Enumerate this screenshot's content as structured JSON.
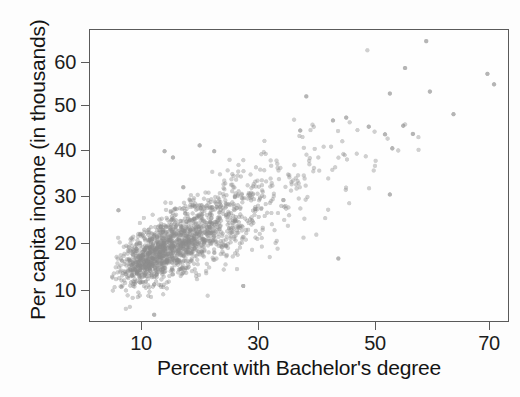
{
  "chart_data": {
    "type": "scatter",
    "title": "",
    "subtitle": "",
    "xlabel": "Percent with Bachelor's degree",
    "ylabel": "Per capita income (in thousands)",
    "xlim": [
      4.5,
      73.5
    ],
    "ylim": [
      7.0,
      67.5
    ],
    "xticks": [
      10,
      30,
      50,
      70
    ],
    "xticklabels": [
      "10",
      "30",
      "50",
      "70"
    ],
    "yticks": [
      10,
      20,
      30,
      40,
      50,
      60
    ],
    "yticklabels": [
      "10",
      "20",
      "30",
      "40",
      "50",
      "60"
    ],
    "grid": false,
    "legend": null,
    "annotations": [],
    "marker": {
      "shape": "circle",
      "color": "#8c8c8c",
      "size_px": 4.4,
      "opacity": 0.4,
      "render": "halftone-grayscale-scan"
    },
    "n_points": 1700,
    "correlation": 0.72,
    "distribution": {
      "x_mean": 19.0,
      "x_sd": 8.2,
      "x_min": 6.0,
      "x_max": 71.5,
      "y_given_x_intercept": 11.4,
      "y_given_x_slope": 0.62,
      "y_residual_sd_base": 2.35,
      "y_residual_sd_growth": 0.085,
      "y_min": 9.0,
      "y_max": 65.5
    },
    "outliers": [
      {
        "x": 60.0,
        "y": 65.2
      },
      {
        "x": 56.5,
        "y": 59.6
      },
      {
        "x": 70.1,
        "y": 58.4
      },
      {
        "x": 71.2,
        "y": 56.2
      },
      {
        "x": 54.0,
        "y": 54.3
      },
      {
        "x": 60.6,
        "y": 54.7
      },
      {
        "x": 40.2,
        "y": 53.7
      },
      {
        "x": 64.5,
        "y": 50.0
      },
      {
        "x": 46.8,
        "y": 49.3
      },
      {
        "x": 44.6,
        "y": 48.7
      },
      {
        "x": 56.2,
        "y": 47.6
      },
      {
        "x": 50.5,
        "y": 47.4
      },
      {
        "x": 39.2,
        "y": 46.6
      },
      {
        "x": 57.8,
        "y": 45.9
      },
      {
        "x": 53.2,
        "y": 45.8
      },
      {
        "x": 22.6,
        "y": 43.5
      },
      {
        "x": 16.8,
        "y": 42.3
      },
      {
        "x": 25.0,
        "y": 42.3
      },
      {
        "x": 18.2,
        "y": 41.0
      },
      {
        "x": 54.4,
        "y": 42.9
      },
      {
        "x": 54.0,
        "y": 33.3
      },
      {
        "x": 45.5,
        "y": 20.0
      },
      {
        "x": 29.8,
        "y": 14.3
      },
      {
        "x": 15.1,
        "y": 8.3
      },
      {
        "x": 9.2,
        "y": 30.0
      },
      {
        "x": 19.9,
        "y": 34.8
      }
    ]
  },
  "axis": {
    "x_title": "Percent with Bachelor's degree",
    "y_title": "Per capita income (in thousands)",
    "x_tick_labels": [
      "10",
      "30",
      "50",
      "70"
    ],
    "y_tick_labels": [
      "10",
      "20",
      "30",
      "40",
      "50",
      "60"
    ]
  },
  "colors": {
    "marker": "#8c8c8c",
    "frame": "#5a5a5a",
    "text": "#141414",
    "background": "#fdfdfd"
  }
}
